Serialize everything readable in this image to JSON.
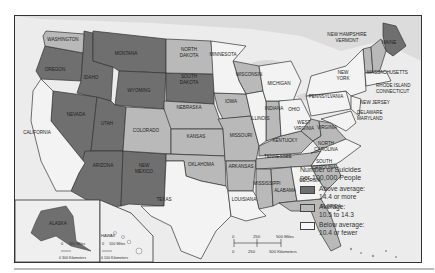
{
  "colors": {
    "above": "#6f6f6f",
    "average": "#b9b9b9",
    "below": "#f3f3f3",
    "canada_water": "#e2e2e2",
    "border": "#333333"
  },
  "legend": {
    "title_line1": "Number of Suicides",
    "title_line2": "per 100,000 People",
    "items": [
      {
        "class": "above",
        "line1": "Above average:",
        "line2": "14.4 or more"
      },
      {
        "class": "average",
        "line1": "Average:",
        "line2": "10.5 to 14.3"
      },
      {
        "class": "below",
        "line1": "Below average:",
        "line2": "10.4 or fewer"
      }
    ]
  },
  "scale_main": {
    "miles_ticks": [
      "0",
      "250",
      "500 Miles"
    ],
    "km_ticks": [
      "0",
      "250",
      "500 Kilometers"
    ]
  },
  "inset_alaska": {
    "label": "ALASKA",
    "miles": "300 Miles",
    "km": "0 300 Kilometers",
    "zero": "0"
  },
  "inset_hawaii": {
    "label": "HAWAII",
    "miles": "100 Miles",
    "km": "0 100 Kilometers",
    "zero": "0"
  },
  "states": {
    "above": [
      "WASHINGTON? no"
    ],
    "above_list": [
      "OREGON",
      "IDAHO",
      "MONTANA",
      "WYOMING",
      "NEVADA",
      "UTAH",
      "ARIZONA",
      "NEW MEXICO",
      "SOUTH DAKOTA",
      "MAINE",
      "ALASKA"
    ],
    "average_list": [
      "WASHINGTON",
      "NORTH DAKOTA",
      "NEBRASKA",
      "COLORADO",
      "KANSAS",
      "OKLAHOMA",
      "IOWA",
      "MISSOURI",
      "ARKANSAS",
      "WISCONSIN",
      "INDIANA",
      "KENTUCKY",
      "TENNESSEE",
      "MISSISSIPPI",
      "ALABAMA",
      "WEST VIRGINIA",
      "VIRGINIA",
      "SOUTH CAROLINA",
      "FLORIDA",
      "NEW HAMPSHIRE",
      "VERMONT"
    ],
    "below_list": [
      "CALIFORNIA",
      "TEXAS",
      "LOUISIANA",
      "MINNESOTA",
      "ILLINOIS",
      "MICHIGAN",
      "OHIO",
      "GEORGIA",
      "NORTH CAROLINA",
      "PENNSYLVANIA",
      "NEW YORK",
      "NEW JERSEY",
      "DELAWARE",
      "MARYLAND",
      "MASSACHUSETTS",
      "RHODE ISLAND",
      "CONNECTICUT",
      "HAWAII"
    ]
  },
  "labels": {
    "washington": "WASHINGTON",
    "oregon": "OREGON",
    "california": "CALIFORNIA",
    "idaho": "IDAHO",
    "nevada": "NEVADA",
    "montana": "MONTANA",
    "wyoming": "WYOMING",
    "utah": "UTAH",
    "arizona": "ARIZONA",
    "colorado": "COLORADO",
    "new_mexico_1": "NEW",
    "new_mexico_2": "MEXICO",
    "north_dakota_1": "NORTH",
    "north_dakota_2": "DAKOTA",
    "south_dakota_1": "SOUTH",
    "south_dakota_2": "DAKOTA",
    "nebraska": "NEBRASKA",
    "kansas": "KANSAS",
    "oklahoma": "OKLAHOMA",
    "texas": "TEXAS",
    "minnesota": "MINNESOTA",
    "iowa": "IOWA",
    "missouri": "MISSOURI",
    "arkansas": "ARKANSAS",
    "louisiana": "LOUISIANA",
    "wisconsin": "WISCONSIN",
    "illinois": "ILLINOIS",
    "michigan": "MICHIGAN",
    "indiana": "INDIANA",
    "ohio": "OHIO",
    "kentucky": "KENTUCKY",
    "tennessee": "TENNESSEE",
    "mississippi": "MISSISSIPPI",
    "alabama": "ALABAMA",
    "georgia": "GEORGIA",
    "florida": "FLORIDA",
    "south_carolina_1": "SOUTH",
    "south_carolina_2": "CAROLINA",
    "north_carolina_1": "NORTH",
    "north_carolina_2": "CAROLINA",
    "west_virginia_1": "WEST",
    "west_virginia_2": "VIRGINIA",
    "virginia": "VIRGINIA",
    "pennsylvania": "PENNSYLVANIA",
    "new_york_1": "NEW",
    "new_york_2": "YORK",
    "new_jersey": "NEW JERSEY",
    "delaware": "DELAWARE",
    "maryland": "MARYLAND",
    "massachusetts": "MASSACHUSETTS",
    "rhode_island": "RHODE ISLAND",
    "connecticut": "CONNECTICUT",
    "new_hampshire": "NEW HAMPSHIRE",
    "vermont": "VERMONT",
    "maine": "MAINE",
    "dc": "D.C."
  }
}
